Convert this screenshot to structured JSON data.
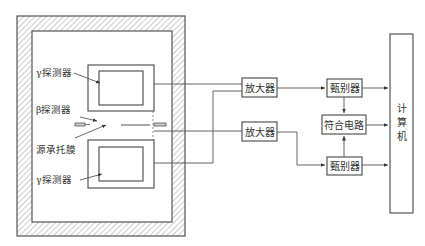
{
  "diagram": {
    "title": "",
    "colors": {
      "line": "#555555",
      "hatch": "#888888",
      "text": "#333333",
      "background": "#ffffff"
    },
    "shielding": {
      "outer": [
        17,
        16,
        185,
        236
      ],
      "inner": [
        32,
        31,
        172,
        222
      ]
    },
    "labels": {
      "gamma_top": "γ探测器",
      "beta": "β探测器",
      "source_film": "源承托膜",
      "gamma_bottom": "γ探测器"
    },
    "blocks": {
      "amp1": "放大器",
      "amp2": "放大器",
      "disc1": "甄别器",
      "disc2": "甄别器",
      "coincidence": "符合电路",
      "computer_1": "计",
      "computer_2": "算",
      "computer_3": "机"
    },
    "connections": [
      {
        "from": "gamma-detector-top",
        "to": "amplifier-1"
      },
      {
        "from": "gamma-detector-bottom",
        "to": "amplifier-1"
      },
      {
        "from": "beta-detector",
        "to": "amplifier-2"
      },
      {
        "from": "amplifier-1",
        "to": "discriminator-1"
      },
      {
        "from": "amplifier-2",
        "to": "discriminator-2"
      },
      {
        "from": "discriminator-1",
        "to": "coincidence-circuit"
      },
      {
        "from": "discriminator-2",
        "to": "coincidence-circuit"
      },
      {
        "from": "discriminator-1",
        "to": "computer"
      },
      {
        "from": "coincidence-circuit",
        "to": "computer"
      },
      {
        "from": "discriminator-2",
        "to": "computer"
      }
    ]
  }
}
